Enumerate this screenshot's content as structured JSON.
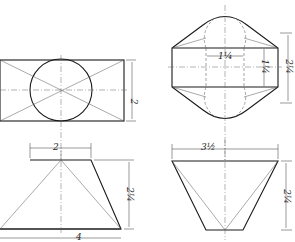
{
  "drawing": {
    "views": [
      {
        "name": "left-top-view",
        "shape": "rectangle with inscribed circle"
      },
      {
        "name": "right-top-view",
        "shape": "hexagonal outline with rounded ends"
      },
      {
        "name": "left-front-view",
        "shape": "trapezoid (frustum)"
      },
      {
        "name": "right-front-view",
        "shape": "inverted trapezoid"
      }
    ],
    "dimensions": {
      "left_top_height": "2",
      "right_top_inner_width": "1¼",
      "right_top_inner_height": "1¼",
      "right_top_overall_height": "2¼",
      "left_front_top_width": "2",
      "left_front_height": "2¼",
      "left_front_bottom_width": "4",
      "right_front_top_width": "3½",
      "right_front_height": "2¼"
    }
  }
}
